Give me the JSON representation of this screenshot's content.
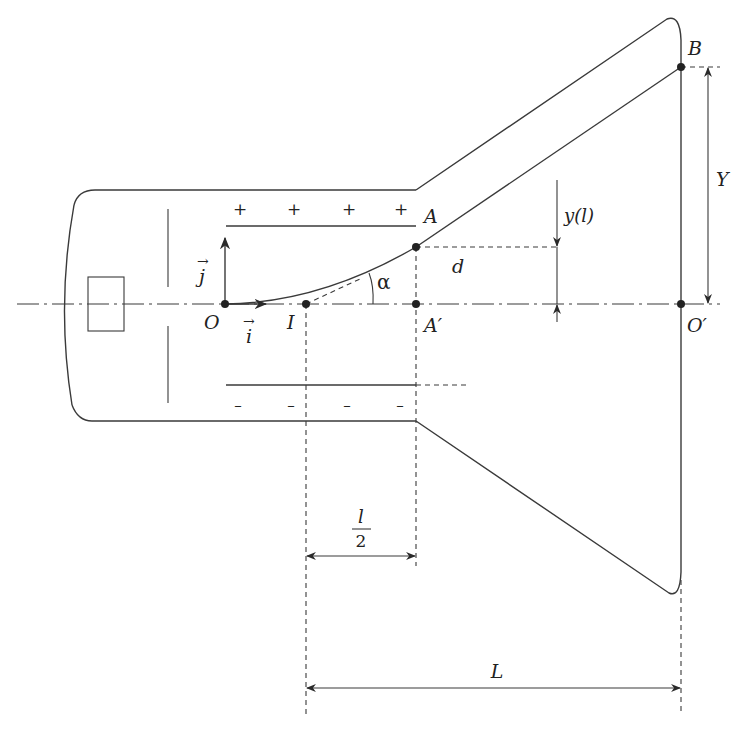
{
  "diagram": {
    "labels": {
      "origin": "O",
      "point_I": "I",
      "point_A": "A",
      "point_A_prime": "A′",
      "point_B": "B",
      "point_O_prime": "O′",
      "unit_i": "i",
      "unit_j": "j",
      "vector_arrow": "→",
      "angle": "α",
      "distance_d": "d",
      "deflection_y": "y(l)",
      "screen_deflection": "Y",
      "half_length_num": "l",
      "half_length_den": "2",
      "length_L": "L"
    },
    "plates": {
      "positive_signs": [
        "+",
        "+",
        "+",
        "+"
      ],
      "negative_signs": [
        "–",
        "–",
        "–",
        "–"
      ]
    },
    "colors": {
      "line": "#3a3a3a",
      "text": "#222222",
      "background": "#ffffff"
    }
  }
}
